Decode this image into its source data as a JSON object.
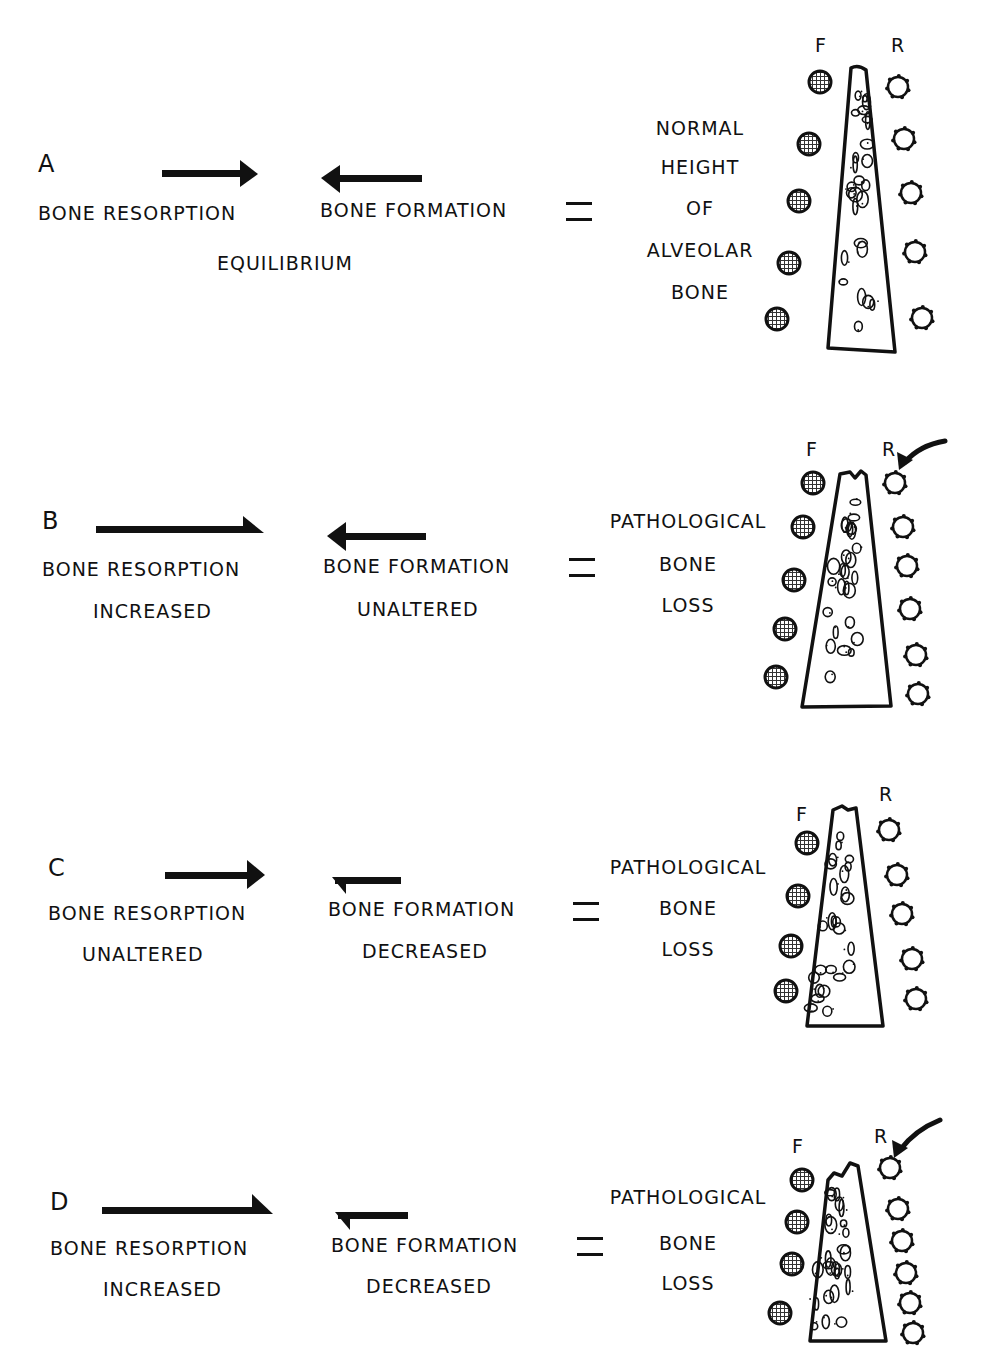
{
  "panels": [
    {
      "letter": "A",
      "resorption": {
        "label": "BONE RESORPTION",
        "status": "",
        "arrow": "normal"
      },
      "formation": {
        "label": "BONE FORMATION",
        "status": "",
        "arrow": "normal"
      },
      "balance_label": "EQUILIBRIUM",
      "equals": "=",
      "result_lines": [
        "NORMAL",
        "HEIGHT",
        "OF",
        "ALVEOLAR",
        "BONE"
      ],
      "cells": {
        "formation_label": "F",
        "resorption_label": "R",
        "formation_count": 5,
        "resorption_count": 5,
        "highlight_arrow": false
      },
      "bone_crest": "normal"
    },
    {
      "letter": "B",
      "resorption": {
        "label": "BONE RESORPTION",
        "status": "INCREASED",
        "arrow": "increased"
      },
      "formation": {
        "label": "BONE FORMATION",
        "status": "UNALTERED",
        "arrow": "normal"
      },
      "balance_label": "",
      "equals": "=",
      "result_lines": [
        "PATHOLOGICAL",
        "BONE",
        "LOSS"
      ],
      "cells": {
        "formation_label": "F",
        "resorption_label": "R",
        "formation_count": 5,
        "resorption_count": 6,
        "highlight_arrow": true
      },
      "bone_crest": "reduced"
    },
    {
      "letter": "C",
      "resorption": {
        "label": "BONE RESORPTION",
        "status": "UNALTERED",
        "arrow": "normal"
      },
      "formation": {
        "label": "BONE FORMATION",
        "status": "DECREASED",
        "arrow": "decreased"
      },
      "balance_label": "",
      "equals": "=",
      "result_lines": [
        "PATHOLOGICAL",
        "BONE",
        "LOSS"
      ],
      "cells": {
        "formation_label": "F",
        "resorption_label": "R",
        "formation_count": 4,
        "resorption_count": 5,
        "highlight_arrow": false
      },
      "bone_crest": "reduced"
    },
    {
      "letter": "D",
      "resorption": {
        "label": "BONE RESORPTION",
        "status": "INCREASED",
        "arrow": "increased"
      },
      "formation": {
        "label": "BONE FORMATION",
        "status": "DECREASED",
        "arrow": "decreased"
      },
      "balance_label": "",
      "equals": "=",
      "result_lines": [
        "PATHOLOGICAL",
        "BONE",
        "LOSS"
      ],
      "cells": {
        "formation_label": "F",
        "resorption_label": "R",
        "formation_count": 4,
        "resorption_count": 6,
        "highlight_arrow": true
      },
      "bone_crest": "severely-reduced"
    }
  ]
}
